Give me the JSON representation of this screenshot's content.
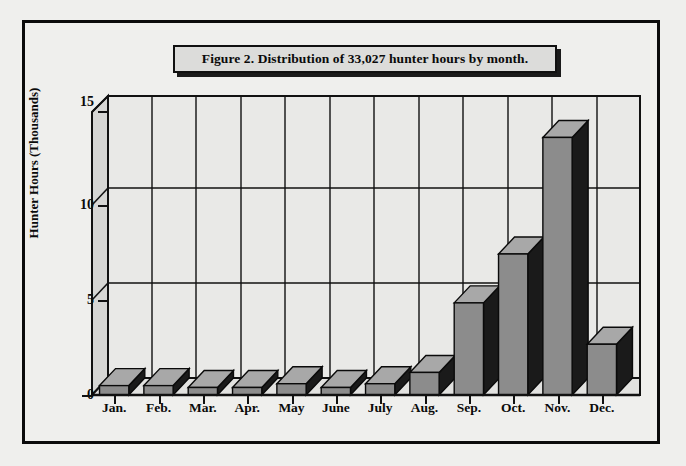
{
  "figure": {
    "title": "Figure 2. Distribution of 33,027 hunter hours by month.",
    "frame_color": "#0b0b0b",
    "background_color": "#efefed",
    "bar_face_color": "#8c8c8c",
    "bar_top_color": "#a8a8a8",
    "bar_side_color": "#1a1a1a",
    "wall_color": "#e9e9e7",
    "gridline_color": "#111111"
  },
  "chart_data": {
    "type": "bar",
    "title": "Figure 2. Distribution of 33,027 hunter hours by month.",
    "xlabel": "",
    "ylabel": "Hunter Hours (Thousands)",
    "categories": [
      "Jan.",
      "Feb.",
      "Mar.",
      "Apr.",
      "May",
      "June",
      "July",
      "Aug.",
      "Sep.",
      "Oct.",
      "Nov.",
      "Dec."
    ],
    "values": [
      0.5,
      0.5,
      0.4,
      0.4,
      0.6,
      0.4,
      0.6,
      1.2,
      4.9,
      7.5,
      13.7,
      2.7
    ],
    "ylim": [
      0,
      15
    ],
    "yticks": [
      0,
      5,
      10,
      15
    ],
    "ytick_labels": [
      "0",
      "5",
      "10",
      "15"
    ],
    "grid": true,
    "legend": null,
    "style": "3d-column",
    "total_hunter_hours": "33,027"
  }
}
